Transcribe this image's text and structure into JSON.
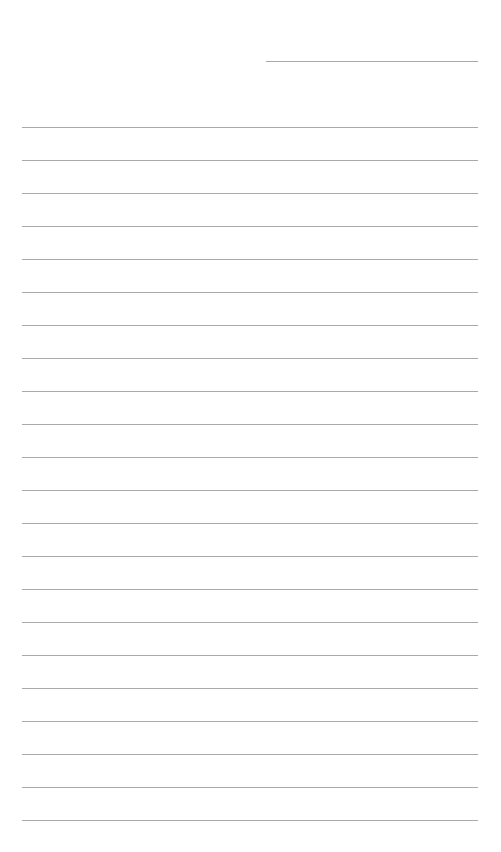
{
  "page": {
    "type": "lined-paper",
    "background_color": "#ffffff",
    "line_color": "#a9a9a9",
    "header_line": {
      "x": 266,
      "y": 61,
      "width": 212
    },
    "lines": {
      "count": 22,
      "start_y": 127,
      "spacing": 33,
      "x": 22,
      "width": 456
    }
  }
}
